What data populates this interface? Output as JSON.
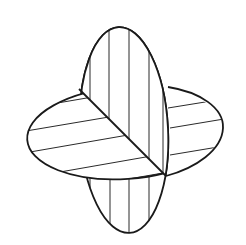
{
  "figure": {
    "colors": {
      "background": "#ffffff",
      "stroke": "#1a1a1a"
    },
    "shapes": [
      {
        "name": "vertical-ellipse-plane",
        "hatch": "vertical"
      },
      {
        "name": "horizontal-ellipse-plane",
        "hatch": "horizontal"
      },
      {
        "name": "intersection-line",
        "from": [
          79,
          89
        ],
        "to": [
          166,
          176
        ]
      }
    ]
  }
}
